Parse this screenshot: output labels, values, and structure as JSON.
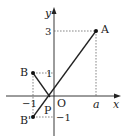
{
  "diagram": {
    "type": "coordinate-plane",
    "axes": {
      "x_label": "x",
      "y_label": "y",
      "origin_label": "O"
    },
    "tick_labels": {
      "x_neg1": "−1",
      "x_a": "a",
      "y_3": "3",
      "y_1": "1",
      "y_neg1": "−1"
    },
    "points": [
      {
        "name": "A",
        "label": "A",
        "coords": "(a, 3)"
      },
      {
        "name": "B",
        "label": "B",
        "coords": "(−1, 1)"
      },
      {
        "name": "B'",
        "label": "B'",
        "coords": "(−1, −1)"
      },
      {
        "name": "P",
        "label": "P",
        "coords": "on x-axis"
      }
    ],
    "segments": [
      "B–P",
      "B'–A"
    ],
    "colors": {
      "line": "#222222",
      "dashed": "#555555",
      "background": "#ffffff"
    }
  }
}
